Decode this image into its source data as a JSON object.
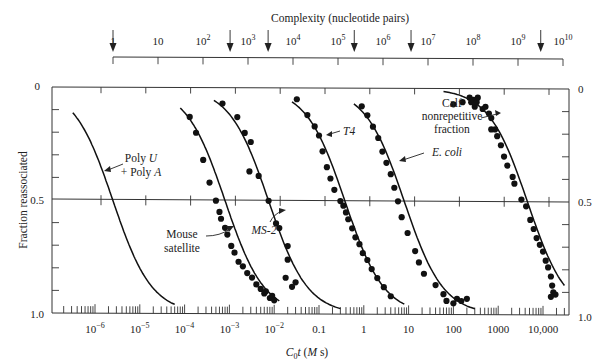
{
  "chart_data": {
    "type": "scatter",
    "title": "Complexity (nucleotide pairs)",
    "xlabel": "C0t (M s)",
    "xlabel_parts": {
      "c": "C",
      "sub": "0",
      "t": "t",
      "open": " (",
      "m": "M",
      "s": " s)"
    },
    "ylabel": "Fraction reassociated",
    "x_scale": "log",
    "xlim": [
      3e-07,
      50000
    ],
    "ylim": [
      0,
      1.0
    ],
    "y_inverted": true,
    "grid": false,
    "bottom_ticks": [
      {
        "value": 1e-06,
        "label": "10",
        "exp": "−6"
      },
      {
        "value": 1e-05,
        "label": "10",
        "exp": "−5"
      },
      {
        "value": 0.0001,
        "label": "10",
        "exp": "−4"
      },
      {
        "value": 0.001,
        "label": "10",
        "exp": "−3"
      },
      {
        "value": 0.01,
        "label": "10",
        "exp": "−2"
      },
      {
        "value": 0.1,
        "label": "0.1",
        "exp": ""
      },
      {
        "value": 1,
        "label": "1",
        "exp": ""
      },
      {
        "value": 10,
        "label": "10",
        "exp": ""
      },
      {
        "value": 100,
        "label": "100",
        "exp": ""
      },
      {
        "value": 1000,
        "label": "1000",
        "exp": ""
      },
      {
        "value": 10000,
        "label": "10,000",
        "exp": ""
      }
    ],
    "top_axis": {
      "title": "Complexity (nucleotide pairs)",
      "ticks": [
        {
          "value": 1,
          "label": "1",
          "exp": ""
        },
        {
          "value": 10,
          "label": "10",
          "exp": ""
        },
        {
          "value": 100,
          "label": "10",
          "exp": "2"
        },
        {
          "value": 1000,
          "label": "10",
          "exp": "3"
        },
        {
          "value": 10000,
          "label": "10",
          "exp": "4"
        },
        {
          "value": 100000,
          "label": "10",
          "exp": "5"
        },
        {
          "value": 1000000,
          "label": "10",
          "exp": "6"
        },
        {
          "value": 10000000,
          "label": "10",
          "exp": "7"
        },
        {
          "value": 100000000,
          "label": "10",
          "exp": "8"
        },
        {
          "value": 1000000000,
          "label": "10",
          "exp": "9"
        },
        {
          "value": 10000000000,
          "label": "10",
          "exp": "10"
        }
      ],
      "arrows_at_complexity": [
        1,
        400,
        2800,
        230000.0,
        4200000.0,
        3200000000.0
      ]
    },
    "y_ticks": [
      {
        "value": 0,
        "label": "0"
      },
      {
        "value": 0.5,
        "label": "0.5"
      },
      {
        "value": 1.0,
        "label": "1.0"
      }
    ],
    "series": [
      {
        "name": "Poly U + Poly A",
        "cot_half": 2.5e-06,
        "curve_range": [
          3.2e-07,
          6e-05
        ],
        "points": []
      },
      {
        "name": "Mouse satellite",
        "cot_half": 0.0008,
        "curve_range": [
          8e-05,
          0.013
        ],
        "points": [
          [
            0.00013,
            0.13
          ],
          [
            0.00018,
            0.2
          ],
          [
            0.00026,
            0.32
          ],
          [
            0.00036,
            0.42
          ],
          [
            0.0005,
            0.5
          ],
          [
            0.0006,
            0.55
          ],
          [
            0.00065,
            0.58
          ],
          [
            0.0008,
            0.62
          ],
          [
            0.0009,
            0.65
          ],
          [
            0.0011,
            0.7
          ],
          [
            0.0013,
            0.73
          ],
          [
            0.0016,
            0.77
          ],
          [
            0.002,
            0.79
          ],
          [
            0.0025,
            0.82
          ],
          [
            0.0032,
            0.84
          ],
          [
            0.004,
            0.87
          ],
          [
            0.005,
            0.89
          ],
          [
            0.006,
            0.91
          ],
          [
            0.0065,
            0.9
          ],
          [
            0.008,
            0.93
          ],
          [
            0.009,
            0.92
          ],
          [
            0.01,
            0.94
          ]
        ]
      },
      {
        "name": "MS-2",
        "cot_half": 0.0075,
        "curve_range": [
          0.00045,
          0.3
        ],
        "points": [
          [
            0.0007,
            0.07
          ],
          [
            0.0015,
            0.13
          ],
          [
            0.0022,
            0.2
          ],
          [
            0.003,
            0.24
          ],
          [
            0.0028,
            0.37
          ],
          [
            0.0045,
            0.39
          ],
          [
            0.0075,
            0.5
          ],
          [
            0.011,
            0.6
          ],
          [
            0.013,
            0.62
          ],
          [
            0.02,
            0.7
          ],
          [
            0.02,
            0.76
          ],
          [
            0.018,
            0.84
          ],
          [
            0.03,
            0.86
          ],
          [
            0.025,
            0.88
          ]
        ]
      },
      {
        "name": "T4",
        "cot_half": 0.38,
        "curve_range": [
          0.025,
          8
        ],
        "points": [
          [
            0.032,
            0.05
          ],
          [
            0.055,
            0.12
          ],
          [
            0.08,
            0.17
          ],
          [
            0.1,
            0.21
          ],
          [
            0.12,
            0.28
          ],
          [
            0.15,
            0.35
          ],
          [
            0.18,
            0.4
          ],
          [
            0.22,
            0.45
          ],
          [
            0.3,
            0.5
          ],
          [
            0.35,
            0.52
          ],
          [
            0.4,
            0.55
          ],
          [
            0.45,
            0.58
          ],
          [
            0.55,
            0.62
          ],
          [
            0.65,
            0.66
          ],
          [
            0.8,
            0.69
          ],
          [
            0.95,
            0.73
          ],
          [
            1.2,
            0.76
          ],
          [
            1.5,
            0.8
          ],
          [
            2,
            0.84
          ],
          [
            2.8,
            0.88
          ],
          [
            4,
            0.92
          ]
        ]
      },
      {
        "name": "E. coli",
        "cot_half": 8,
        "curve_range": [
          0.6,
          300
        ],
        "points": [
          [
            0.9,
            0.08
          ],
          [
            1.2,
            0.12
          ],
          [
            1.6,
            0.17
          ],
          [
            2.1,
            0.22
          ],
          [
            2.6,
            0.28
          ],
          [
            3.2,
            0.33
          ],
          [
            4,
            0.38
          ],
          [
            4.8,
            0.44
          ],
          [
            5.8,
            0.5
          ],
          [
            7,
            0.57
          ],
          [
            9.5,
            0.64
          ],
          [
            14,
            0.72
          ],
          [
            17,
            0.77
          ],
          [
            22,
            0.82
          ],
          [
            40,
            0.87
          ],
          [
            60,
            0.91
          ],
          [
            70,
            0.94
          ],
          [
            100,
            0.95
          ],
          [
            120,
            0.93
          ],
          [
            150,
            0.94
          ],
          [
            200,
            0.93
          ]
        ]
      },
      {
        "name": "Calf nonrepetitive fraction",
        "cot_half": 4500,
        "curve_range": [
          60,
          30000
        ],
        "points": [
          [
            100,
            0.07
          ],
          [
            160,
            0.06
          ],
          [
            230,
            0.04
          ],
          [
            250,
            0.06
          ],
          [
            280,
            0.05
          ],
          [
            300,
            0.08
          ],
          [
            330,
            0.06
          ],
          [
            350,
            0.04
          ],
          [
            450,
            0.09
          ],
          [
            520,
            0.08
          ],
          [
            620,
            0.11
          ],
          [
            700,
            0.13
          ],
          [
            700,
            0.18
          ],
          [
            850,
            0.18
          ],
          [
            950,
            0.21
          ],
          [
            1150,
            0.25
          ],
          [
            1350,
            0.3
          ],
          [
            1600,
            0.34
          ],
          [
            2100,
            0.39
          ],
          [
            2300,
            0.42
          ],
          [
            3300,
            0.49
          ],
          [
            4200,
            0.52
          ],
          [
            5200,
            0.58
          ],
          [
            6200,
            0.62
          ],
          [
            7200,
            0.66
          ],
          [
            8500,
            0.69
          ],
          [
            10000,
            0.72
          ],
          [
            11500,
            0.76
          ],
          [
            13000,
            0.79
          ],
          [
            15000,
            0.83
          ],
          [
            16000,
            0.87
          ],
          [
            17000,
            0.9
          ],
          [
            19000,
            0.91
          ],
          [
            15000,
            0.92
          ]
        ]
      }
    ],
    "annotations": [
      {
        "text_parts": [
          {
            "t": "Poly ",
            "i": false
          },
          {
            "t": "U",
            "i": true
          }
        ],
        "line2_parts": [
          {
            "t": "+ Poly ",
            "i": false
          },
          {
            "t": "A",
            "i": true
          }
        ],
        "points_to": "Poly U + Poly A"
      },
      {
        "text": "Mouse",
        "line2": "satellite",
        "points_to": "Mouse satellite"
      },
      {
        "text": "MS-2",
        "italic": true,
        "points_to": "MS-2"
      },
      {
        "text": "T4",
        "italic": true,
        "points_to": "T4"
      },
      {
        "text": "E. coli",
        "italic": true,
        "points_to": "E. coli"
      },
      {
        "text": "Calf",
        "line2": "nonrepetitive",
        "line3": "fraction",
        "points_to": "Calf nonrepetitive fraction"
      }
    ]
  },
  "labels": {
    "top_title": "Complexity (nucleotide pairs)",
    "ylabel": "Fraction reassociated",
    "y_left_0": "0",
    "y_left_05": "0.5",
    "y_left_1": "1.0",
    "y_right_0": "0",
    "y_right_05": "0.5",
    "y_right_1": "1.0",
    "ann_polyu_1a": "Poly ",
    "ann_polyu_1b": "U",
    "ann_polyu_2a": "+ Poly ",
    "ann_polyu_2b": "A",
    "ann_mouse_1": "Mouse",
    "ann_mouse_2": "satellite",
    "ann_ms2": "MS-2",
    "ann_t4": "T4",
    "ann_ecoli": "E. coli",
    "ann_calf_1": "Calf",
    "ann_calf_2": "nonrepetitive",
    "ann_calf_3": "fraction",
    "xlabel_c": "C",
    "xlabel_sub": "0",
    "xlabel_t": "t",
    "xlabel_open": " (",
    "xlabel_m": "M",
    "xlabel_s": " s)"
  }
}
